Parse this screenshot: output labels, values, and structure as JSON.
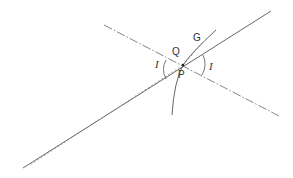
{
  "diagram": {
    "type": "geometric-optics-refraction",
    "labels": {
      "G": "G",
      "Q": "Q",
      "P": "P",
      "angle_left": "I",
      "angle_right": "I"
    },
    "colors": {
      "line": "#555555",
      "background": "#ffffff"
    },
    "elements": [
      {
        "name": "solid-ray",
        "style": "solid",
        "from": [
          23,
          168
        ],
        "to": [
          271,
          11
        ]
      },
      {
        "name": "dash-dot-normal",
        "style": "dash-dot",
        "from": [
          104,
          25
        ],
        "to": [
          279,
          116
        ]
      },
      {
        "name": "dashed-ray",
        "style": "dashed",
        "from": [
          183,
          65
        ],
        "to": [
          28,
          166
        ]
      },
      {
        "name": "curve-surface",
        "style": "solid",
        "through": [
          [
            216,
            30
          ],
          [
            183,
            65
          ],
          [
            172,
            115
          ]
        ]
      }
    ]
  }
}
